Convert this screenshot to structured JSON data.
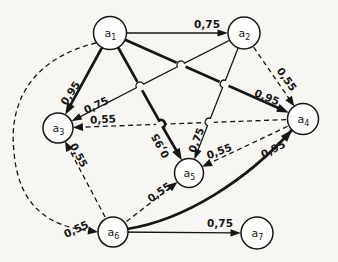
{
  "figure": {
    "width": 338,
    "height": 262,
    "background": "#f7f6f3",
    "ink": "#161616"
  },
  "graph": {
    "type": "directed-weighted-graph",
    "nodes": [
      {
        "id": "a1",
        "base": "a",
        "sub": "1",
        "x": 110,
        "y": 33,
        "r": 16.5
      },
      {
        "id": "a2",
        "base": "a",
        "sub": "2",
        "x": 244,
        "y": 33,
        "r": 16
      },
      {
        "id": "a3",
        "base": "a",
        "sub": "3",
        "x": 58,
        "y": 128,
        "r": 15
      },
      {
        "id": "a4",
        "base": "a",
        "sub": "4",
        "x": 303,
        "y": 119,
        "r": 15.5
      },
      {
        "id": "a5",
        "base": "a",
        "sub": "5",
        "x": 189,
        "y": 173,
        "r": 14.5
      },
      {
        "id": "a6",
        "base": "a",
        "sub": "6",
        "x": 113,
        "y": 232,
        "r": 15
      },
      {
        "id": "a7",
        "base": "a",
        "sub": "7",
        "x": 257,
        "y": 233,
        "r": 16
      }
    ],
    "edges": [
      {
        "from": "a1",
        "to": "a4",
        "weight": "0,95",
        "style": "thick",
        "label": {
          "x": 267,
          "y": 97,
          "rot": 22
        }
      },
      {
        "from": "a4",
        "to": "a3",
        "weight": "0,55",
        "style": "dashed",
        "label": {
          "x": 103,
          "y": 119,
          "rot": -3
        }
      },
      {
        "from": "a1",
        "to": "a5",
        "weight": "0,95",
        "style": "thick",
        "label": {
          "x": 160,
          "y": 146,
          "rot": -119
        },
        "hops": [
          [
            161,
            124,
            1
          ]
        ]
      },
      {
        "from": "a2",
        "to": "a3",
        "weight": "0,75",
        "style": "thin",
        "label": {
          "x": 96,
          "y": 105,
          "rot": -25
        },
        "hops": [
          [
            181,
            65,
            0
          ],
          [
            140,
            86,
            0
          ]
        ]
      },
      {
        "from": "a2",
        "to": "a5",
        "weight": "0,75",
        "style": "thin",
        "label": {
          "x": 196,
          "y": 140,
          "rot": -69
        },
        "hops": [
          [
            224,
            84,
            0
          ],
          [
            209,
            122,
            0
          ]
        ]
      },
      {
        "from": "a1",
        "to": "a2",
        "weight": "0,75",
        "style": "thin",
        "label": {
          "x": 207,
          "y": 24,
          "rot": 0
        }
      },
      {
        "from": "a1",
        "to": "a3",
        "weight": "0,95",
        "style": "thick",
        "label": {
          "x": 70,
          "y": 93,
          "rot": -57
        }
      },
      {
        "from": "a2",
        "to": "a4",
        "weight": "0,55",
        "style": "dashed",
        "label": {
          "x": 287,
          "y": 79,
          "rot": 55
        }
      },
      {
        "from": "a4",
        "to": "a5",
        "weight": "0,55",
        "style": "dashed",
        "label": {
          "x": 219,
          "y": 151,
          "rot": -20
        }
      },
      {
        "from": "a6",
        "to": "a3",
        "weight": "0,55",
        "style": "dashed",
        "label": {
          "x": 79,
          "y": 155,
          "rot": 62
        }
      },
      {
        "from": "a6",
        "to": "a5",
        "weight": "0,55",
        "style": "dashed",
        "label": {
          "x": 159,
          "y": 192,
          "rot": -35
        }
      },
      {
        "from": "a1",
        "to": "a6",
        "weight": "0,55",
        "style": "dashed",
        "label": {
          "x": 76,
          "y": 229,
          "rot": -25
        },
        "path": "M 96 43 C 34 58, 8 100, 14 152 C 18 202, 45 229, 97 231",
        "tip": [
          98,
          232
        ],
        "tip_angle": 8
      },
      {
        "from": "a6",
        "to": "a4",
        "weight": "0,95",
        "style": "thick",
        "label": {
          "x": 273,
          "y": 149,
          "rot": -27
        },
        "path": "M 127 229 C 185 220, 247 180, 292 130",
        "tip": [
          292,
          130
        ],
        "tip_angle": -48
      },
      {
        "from": "a6",
        "to": "a7",
        "weight": "0,75",
        "style": "thin",
        "label": {
          "x": 220,
          "y": 223,
          "rot": 0
        }
      }
    ],
    "edge_style_legend": {
      "thick": "0,95",
      "thin": "0,75",
      "dashed": "0,55"
    }
  }
}
